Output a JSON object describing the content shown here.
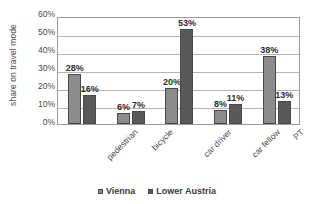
{
  "chart_data": {
    "type": "bar",
    "title": "",
    "xlabel": "",
    "ylabel": "share on travel mode",
    "categories": [
      "pedestrian",
      "bicycle",
      "car driver",
      "car fellow",
      "PT"
    ],
    "series": [
      {
        "name": "Vienna",
        "color": "#8c8c8c",
        "values": [
          28,
          6,
          20,
          8,
          38
        ],
        "labels": [
          "28%",
          "6%",
          "20%",
          "8%",
          "38%"
        ]
      },
      {
        "name": "Lower Austria",
        "color": "#595959",
        "values": [
          16,
          7,
          53,
          11,
          13
        ],
        "labels": [
          "16%",
          "7%",
          "53%",
          "11%",
          "13%"
        ]
      }
    ],
    "ylim": [
      0,
      60
    ],
    "ytick_values": [
      0,
      10,
      20,
      30,
      40,
      50,
      60
    ],
    "ytick_labels": [
      "0%",
      "10%",
      "20%",
      "30%",
      "40%",
      "50%",
      "60%"
    ],
    "grid": true,
    "legend_position": "bottom",
    "value_labels": true,
    "category_label_rotation": -45
  },
  "axis": {
    "y_title": "share on travel mode"
  },
  "legend": {
    "items": [
      {
        "label": "Vienna",
        "color": "#8c8c8c"
      },
      {
        "label": "Lower Austria",
        "color": "#595959"
      }
    ]
  },
  "colors": {
    "series_vienna": "#8c8c8c",
    "series_lower_austria": "#595959",
    "gridline": "#b4b4b4",
    "plot_border": "#9b9b9b",
    "text": "#4a4a4a",
    "background": "#ffffff"
  }
}
